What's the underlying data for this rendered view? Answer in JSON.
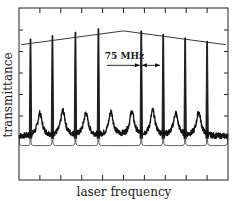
{
  "chart_data": {
    "type": "line",
    "title": "",
    "xlabel": "laser frequency",
    "ylabel": "transmittance",
    "xlim": [
      0,
      10
    ],
    "ylim": [
      -0.3,
      1.2
    ],
    "grid": false,
    "x_ticks_count": 9,
    "y_ticks_count": 6,
    "annotation": {
      "text": "75 MHz",
      "span_from": 5.83,
      "span_to": 6.8,
      "y": 0.7
    },
    "series": [
      {
        "name": "envelope",
        "style": "thin-line",
        "x": [
          0.1,
          5.0,
          9.9
        ],
        "y": [
          0.88,
          1.0,
          0.88
        ]
      },
      {
        "name": "sharp-transmission-peaks",
        "style": "narrow-peaks",
        "peak_x": [
          0.55,
          1.6,
          2.7,
          3.8,
          5.85,
          6.9,
          7.95,
          9.0
        ],
        "peak_y": [
          0.93,
          0.96,
          0.99,
          1.02,
          1.0,
          0.97,
          0.94,
          0.91
        ],
        "baseline": 0.0
      },
      {
        "name": "broad-noisy-peaks",
        "style": "noisy-broad-peaks",
        "peak_x": [
          1.0,
          2.1,
          3.2,
          4.4,
          5.4,
          6.4,
          7.5,
          8.6
        ],
        "peak_y": [
          0.28,
          0.3,
          0.28,
          0.29,
          0.29,
          0.3,
          0.28,
          0.29
        ],
        "baseline": 0.08
      },
      {
        "name": "lower-mode-curves",
        "style": "rounded-wells",
        "segment_edges": [
          0.0,
          0.55,
          1.6,
          2.7,
          3.8,
          5.85,
          6.9,
          7.95,
          9.0,
          10.0
        ],
        "level": 0.0,
        "rise": 0.06
      }
    ]
  }
}
